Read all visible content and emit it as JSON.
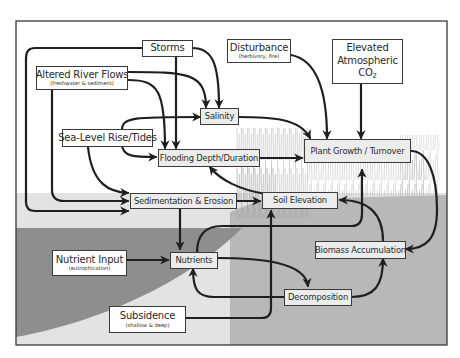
{
  "diagram": {
    "colors": {
      "frame": "#3a3a3a",
      "sky": "#ffffff",
      "marsh_band": "#e3e3e3",
      "ground": "#b4b4b4",
      "deep_subsidence": "#8e8e8e",
      "arrow": "#1f1f1f",
      "process_box": "#ececec",
      "driver_box": "#ffffff"
    },
    "drivers": {
      "storms": {
        "label": "Storms"
      },
      "altered_river_flows": {
        "label": "Altered River Flows",
        "sub": "(freshwater & sediment)"
      },
      "disturbance": {
        "label": "Disturbance",
        "sub": "(herbivory, fire)"
      },
      "elevated_co2": {
        "line1": "Elevated",
        "line2": "Atmospheric",
        "line3": "CO",
        "line3_sub": "2"
      },
      "sea_level": {
        "label": "Sea-Level Rise/Tides"
      },
      "nutrient_input": {
        "label": "Nutrient Input",
        "sub": "(eutrophication)"
      },
      "subsidence": {
        "label": "Subsidence",
        "sub": "(shallow & deep)"
      }
    },
    "processes": {
      "salinity": {
        "label": "Salinity"
      },
      "flooding": {
        "label": "Flooding Depth/Duration"
      },
      "plant_growth": {
        "label": "Plant Growth / Turnover"
      },
      "sedimentation": {
        "label": "Sedimentation & Erosion"
      },
      "soil_elevation": {
        "label": "Soil Elevation"
      },
      "nutrients": {
        "label": "Nutrients"
      },
      "biomass": {
        "label": "Biomass Accumulation"
      },
      "decomposition": {
        "label": "Decomposition"
      }
    },
    "edges": [
      {
        "from": "Storms",
        "to": "Salinity"
      },
      {
        "from": "Storms",
        "to": "Flooding Depth/Duration"
      },
      {
        "from": "Storms",
        "to": "Sedimentation & Erosion"
      },
      {
        "from": "Altered River Flows",
        "to": "Salinity"
      },
      {
        "from": "Altered River Flows",
        "to": "Flooding Depth/Duration"
      },
      {
        "from": "Altered River Flows",
        "to": "Sedimentation & Erosion"
      },
      {
        "from": "Sea-Level Rise/Tides",
        "to": "Salinity"
      },
      {
        "from": "Sea-Level Rise/Tides",
        "to": "Flooding Depth/Duration"
      },
      {
        "from": "Sea-Level Rise/Tides",
        "to": "Sedimentation & Erosion"
      },
      {
        "from": "Disturbance",
        "to": "Plant Growth / Turnover"
      },
      {
        "from": "Elevated Atmospheric CO2",
        "to": "Plant Growth / Turnover"
      },
      {
        "from": "Salinity",
        "to": "Plant Growth / Turnover"
      },
      {
        "from": "Flooding Depth/Duration",
        "to": "Plant Growth / Turnover"
      },
      {
        "from": "Soil Elevation",
        "to": "Flooding Depth/Duration"
      },
      {
        "from": "Sedimentation & Erosion",
        "to": "Soil Elevation"
      },
      {
        "from": "Sedimentation & Erosion",
        "to": "Nutrients"
      },
      {
        "from": "Nutrient Input",
        "to": "Nutrients"
      },
      {
        "from": "Nutrients",
        "to": "Plant Growth / Turnover"
      },
      {
        "from": "Nutrients",
        "to": "Decomposition"
      },
      {
        "from": "Decomposition",
        "to": "Nutrients"
      },
      {
        "from": "Decomposition",
        "to": "Biomass Accumulation"
      },
      {
        "from": "Plant Growth / Turnover",
        "to": "Biomass Accumulation"
      },
      {
        "from": "Biomass Accumulation",
        "to": "Soil Elevation"
      },
      {
        "from": "Subsidence",
        "to": "Soil Elevation"
      }
    ]
  }
}
